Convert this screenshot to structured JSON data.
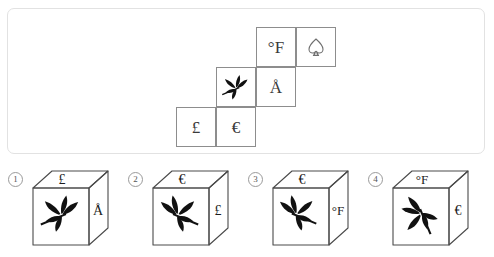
{
  "puzzle": {
    "type": "cube-net-folding",
    "net": {
      "description": "Staircase net of a cube with six square cells",
      "grid_cols": 4,
      "grid_rows": 3,
      "cells": [
        {
          "id": "cell-fahrenheit",
          "row": 0,
          "col": 2,
          "symbol": "°F",
          "icon": "degree-fahrenheit-icon"
        },
        {
          "id": "cell-spade",
          "row": 0,
          "col": 3,
          "symbol": "♤",
          "icon": "spade-outline-icon"
        },
        {
          "id": "cell-leaf",
          "row": 1,
          "col": 1,
          "symbol": "leaf-sprig",
          "icon": "leaf-sprig-icon"
        },
        {
          "id": "cell-angstrom",
          "row": 1,
          "col": 2,
          "symbol": "Å",
          "icon": "angstrom-icon"
        },
        {
          "id": "cell-pound",
          "row": 2,
          "col": 0,
          "symbol": "£",
          "icon": "pound-sterling-icon"
        },
        {
          "id": "cell-euro",
          "row": 2,
          "col": 1,
          "symbol": "€",
          "icon": "euro-icon"
        }
      ]
    },
    "options": [
      {
        "number": "1",
        "top_face": "£",
        "front_face": "leaf-sprig",
        "right_face": "Å",
        "leaf_orientation": "stem-lower-right"
      },
      {
        "number": "2",
        "top_face": "€",
        "front_face": "leaf-sprig",
        "right_face": "£",
        "leaf_orientation": "stem-lower-left"
      },
      {
        "number": "3",
        "top_face": "€",
        "front_face": "leaf-sprig",
        "right_face": "°F",
        "leaf_orientation": "stem-lower-left"
      },
      {
        "number": "4",
        "top_face": "°F",
        "front_face": "leaf-sprig",
        "right_face": "€",
        "leaf_orientation": "stem-down-upright"
      }
    ]
  },
  "colors": {
    "panel_border": "#e2e2e2",
    "net_cell_border": "#8d8d8d",
    "glyph": "#3a3a3a",
    "cube_outline": "#4a4a4a",
    "leaf_fill": "#111111",
    "option_number": "#555555",
    "background": "#ffffff"
  }
}
